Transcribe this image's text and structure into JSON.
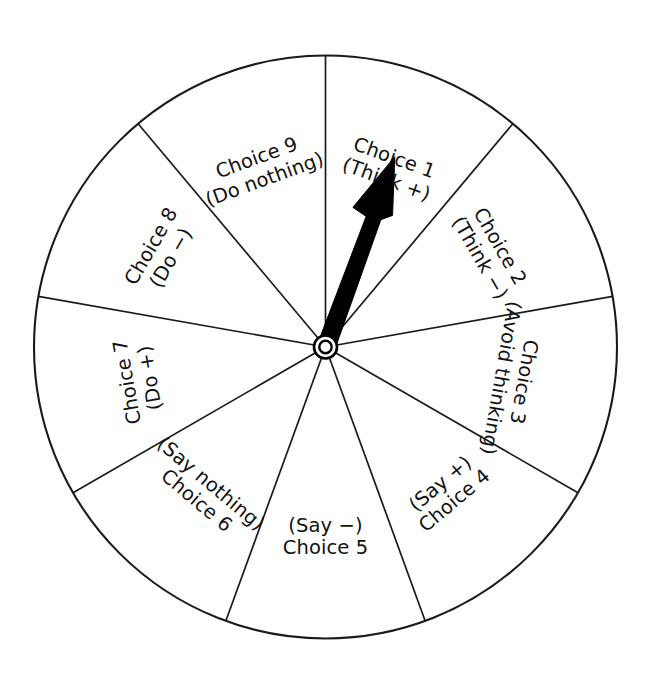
{
  "diagram": {
    "type": "choice-wheel",
    "sector_count": 9,
    "sector_angle_deg": 40,
    "pointer": {
      "name": "spinner-arrow",
      "points_to_sector": 1,
      "points_to_label": "Choice 1 (Think +)",
      "angle_deg_from_top": 20,
      "color": "#000000"
    },
    "hub": {
      "name": "center-hub",
      "style": "double-ring",
      "color": "#000000"
    },
    "rim": {
      "stroke_color": "#000000",
      "fill_color": "#ffffff"
    },
    "sectors": [
      {
        "index": 1,
        "number_label": "Choice 1",
        "detail_label": "(Think +)",
        "start_angle_deg": 0,
        "end_angle_deg": 40,
        "mid_angle_deg": 20,
        "text_orientation": "upright-radial"
      },
      {
        "index": 2,
        "number_label": "Choice 2",
        "detail_label": "(Think −)",
        "start_angle_deg": 40,
        "end_angle_deg": 80,
        "mid_angle_deg": 60,
        "text_orientation": "upright-radial"
      },
      {
        "index": 3,
        "number_label": "Choice 3",
        "detail_label": "(Avoid thinking)",
        "start_angle_deg": 80,
        "end_angle_deg": 120,
        "mid_angle_deg": 100,
        "text_orientation": "upright-radial"
      },
      {
        "index": 4,
        "number_label": "Choice 4",
        "detail_label": "(Say +)",
        "start_angle_deg": 120,
        "end_angle_deg": 160,
        "mid_angle_deg": 140,
        "text_orientation": "inverted-radial"
      },
      {
        "index": 5,
        "number_label": "Choice 5",
        "detail_label": "(Say −)",
        "start_angle_deg": 160,
        "end_angle_deg": 200,
        "mid_angle_deg": 180,
        "text_orientation": "inverted-radial"
      },
      {
        "index": 6,
        "number_label": "Choice 6",
        "detail_label": "(Say nothing)",
        "start_angle_deg": 200,
        "end_angle_deg": 240,
        "mid_angle_deg": 220,
        "text_orientation": "inverted-radial"
      },
      {
        "index": 7,
        "number_label": "Choice 7",
        "detail_label": "(Do +)",
        "start_angle_deg": 240,
        "end_angle_deg": 280,
        "mid_angle_deg": 260,
        "text_orientation": "upright-radial"
      },
      {
        "index": 8,
        "number_label": "Choice 8",
        "detail_label": "(Do −)",
        "start_angle_deg": 280,
        "end_angle_deg": 320,
        "mid_angle_deg": 300,
        "text_orientation": "upright-radial"
      },
      {
        "index": 9,
        "number_label": "Choice 9",
        "detail_label": "(Do nothing)",
        "start_angle_deg": 320,
        "end_angle_deg": 360,
        "mid_angle_deg": 340,
        "text_orientation": "upright-radial"
      }
    ]
  }
}
